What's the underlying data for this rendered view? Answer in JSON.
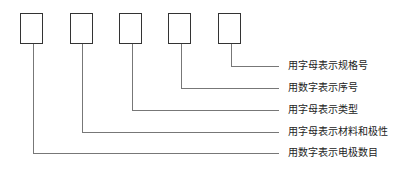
{
  "diagram": {
    "boxes": 5,
    "labels": [
      "用字母表示规格号",
      "用数字表示序号",
      "用字母表示类型",
      "用字母表示材料和极性",
      "用数字表示电极数目"
    ]
  }
}
